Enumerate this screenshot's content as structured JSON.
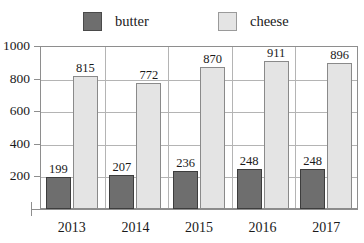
{
  "chart_data": {
    "type": "bar",
    "title": "",
    "xlabel": "",
    "ylabel": "",
    "categories": [
      "2013",
      "2014",
      "2015",
      "2016",
      "2017"
    ],
    "series": [
      {
        "name": "butter",
        "color": "#6e6e6e",
        "values": [
          199,
          207,
          236,
          248,
          248
        ]
      },
      {
        "name": "cheese",
        "color": "#e4e4e4",
        "values": [
          815,
          772,
          870,
          911,
          896
        ]
      }
    ],
    "ylim": [
      0,
      1000
    ],
    "yticks": [
      200,
      400,
      600,
      800,
      1000
    ],
    "ytick_labels": [
      "200",
      "400",
      "600",
      "800",
      "1000"
    ],
    "grid": true,
    "grid_axis": "both",
    "legend_position": "top",
    "value_labels": true
  },
  "legend": {
    "items": [
      {
        "label": "butter",
        "swatch": "butter-legend-swatch"
      },
      {
        "label": "cheese",
        "swatch": "cheese-legend-swatch"
      }
    ]
  },
  "colors": {
    "butter": "#6e6e6e",
    "cheese": "#e4e4e4",
    "axis": "#8e8e8e",
    "grid": "#b4b4b4",
    "background": "#ffffff",
    "text": "#1a1a1a"
  }
}
